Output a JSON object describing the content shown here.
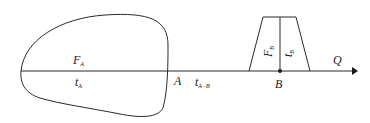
{
  "diagram": {
    "type": "flow-axis-diagram",
    "region_a": {
      "shape": "irregular-closed-curve",
      "top_label": "F",
      "top_label_sub": "A",
      "bottom_label": "t",
      "bottom_label_sub": "A"
    },
    "point_a": {
      "label": "A"
    },
    "segment_ab": {
      "label": "t",
      "label_sub": "A−B"
    },
    "region_b": {
      "shape": "trapezoid",
      "left_label": "F",
      "left_label_sub": "B",
      "right_label": "t",
      "right_label_sub": "B"
    },
    "point_b": {
      "label": "B"
    },
    "axis": {
      "label": "Q",
      "direction": "right"
    },
    "colors": {
      "stroke": "#2a2a2a",
      "background": "#ffffff"
    }
  }
}
